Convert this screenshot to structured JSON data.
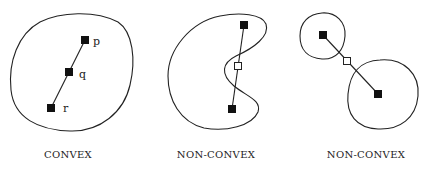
{
  "panels": [
    {
      "label": "CONVEX",
      "points": [
        {
          "name": "p",
          "x": 85,
          "y": 40,
          "filled": true
        },
        {
          "name": "q",
          "x": 69,
          "y": 72,
          "filled": true
        },
        {
          "name": "r",
          "x": 51,
          "y": 108,
          "filled": true
        }
      ]
    },
    {
      "label": "NON-CONVEX",
      "points": [
        {
          "x": 244,
          "y": 25,
          "filled": true
        },
        {
          "x": 238,
          "y": 66,
          "filled": false
        },
        {
          "x": 232,
          "y": 109,
          "filled": true
        }
      ]
    },
    {
      "label": "NON-CONVEX",
      "points": [
        {
          "x": 323,
          "y": 35,
          "filled": true
        },
        {
          "x": 347,
          "y": 61,
          "filled": false
        },
        {
          "x": 378,
          "y": 94,
          "filled": true
        }
      ]
    }
  ],
  "colors": {
    "stroke": "#222222",
    "background": "#ffffff"
  }
}
